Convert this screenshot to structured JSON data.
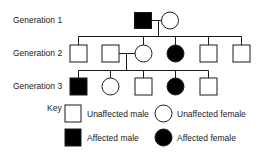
{
  "diagram": {
    "type": "pedigree",
    "generations": [
      {
        "label": "Generation 1",
        "individuals": [
          {
            "sex": "male",
            "affected": true
          },
          {
            "sex": "female",
            "affected": false
          }
        ]
      },
      {
        "label": "Generation 2",
        "individuals": [
          {
            "sex": "male",
            "affected": false
          },
          {
            "sex": "male",
            "affected": false,
            "note": "married-in spouse"
          },
          {
            "sex": "female",
            "affected": false
          },
          {
            "sex": "female",
            "affected": true
          },
          {
            "sex": "male",
            "affected": false
          },
          {
            "sex": "male",
            "affected": false
          }
        ]
      },
      {
        "label": "Generation 3",
        "individuals": [
          {
            "sex": "male",
            "affected": true
          },
          {
            "sex": "female",
            "affected": false
          },
          {
            "sex": "male",
            "affected": false
          },
          {
            "sex": "female",
            "affected": true
          },
          {
            "sex": "male",
            "affected": false
          }
        ]
      }
    ]
  },
  "key": {
    "title": "Key",
    "unaffected_male": "Unaffected male",
    "unaffected_female": "Unaffected female",
    "affected_male": "Affected male",
    "affected_female": "Affected female"
  },
  "colors": {
    "stroke": "#1a1a1a",
    "affected_fill": "#000000",
    "unaffected_fill": "#ffffff"
  }
}
